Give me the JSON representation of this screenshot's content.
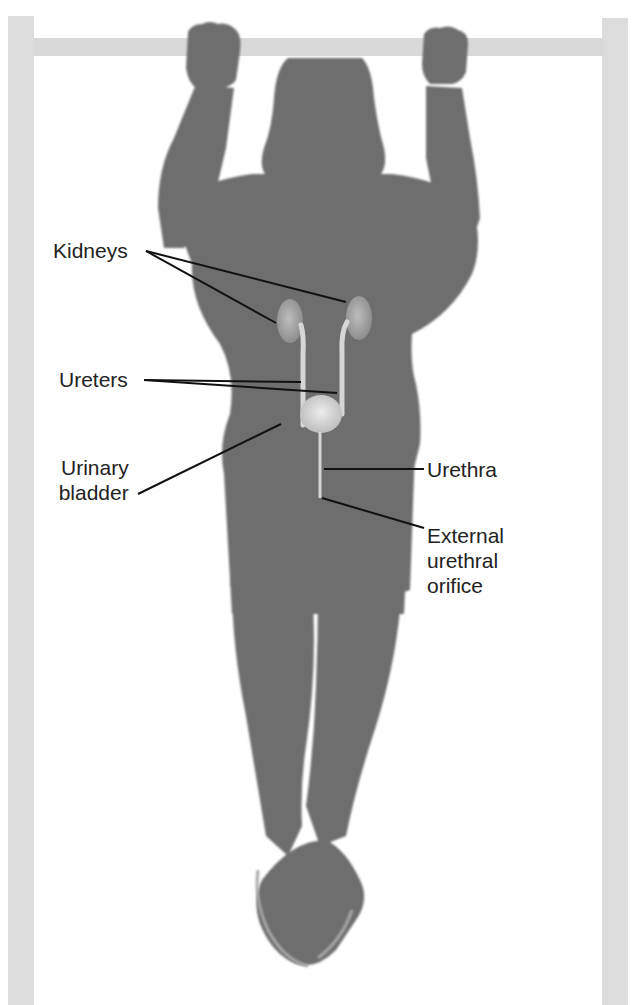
{
  "figure": {
    "colors": {
      "background": "#ffffff",
      "bar": "#d9d9d9",
      "silhouette": "#6e6e6e",
      "organ": "#d4d4d4",
      "leader_line": "#111111",
      "label_text": "#222222"
    }
  },
  "labels": {
    "kidneys": "Kidneys",
    "ureters": "Ureters",
    "bladder_line1": "Urinary",
    "bladder_line2": "bladder",
    "urethra": "Urethra",
    "orifice_line1": "External",
    "orifice_line2": "urethral",
    "orifice_line3": "orifice"
  }
}
